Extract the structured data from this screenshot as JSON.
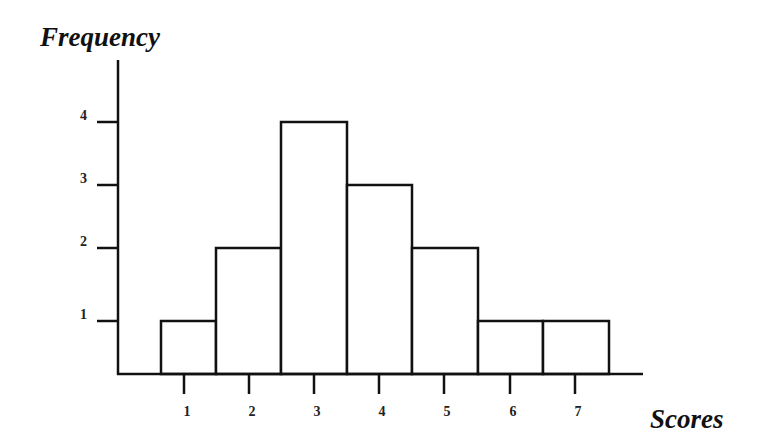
{
  "chart_data": {
    "type": "bar",
    "subtype": "histogram",
    "title": "",
    "xlabel": "Scores",
    "ylabel": "Frequency",
    "categories": [
      "1",
      "2",
      "3",
      "4",
      "5",
      "6",
      "7"
    ],
    "values": [
      1,
      2,
      4,
      3,
      2,
      1,
      1
    ],
    "x_ticks": [
      "1",
      "2",
      "3",
      "4",
      "5",
      "6",
      "7"
    ],
    "y_ticks": [
      "1",
      "2",
      "3",
      "4"
    ],
    "ylim": [
      0,
      4.7
    ],
    "grid": false,
    "legend": null,
    "colors": {
      "bar_fill": "#ffffff",
      "bar_stroke": "#111111",
      "axis": "#111111"
    }
  }
}
